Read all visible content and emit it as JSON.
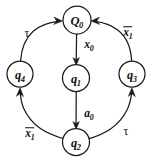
{
  "diagram": {
    "type": "state-transition-graph",
    "title": "",
    "width": 154,
    "height": 162,
    "background_color": "#ffffff",
    "stroke_color": "#1a1a1a",
    "nodes": [
      {
        "id": "Q0",
        "base": "Q",
        "sub": "0",
        "cx": 77,
        "cy": 20,
        "r": 14
      },
      {
        "id": "q1",
        "base": "q",
        "sub": "1",
        "cx": 76,
        "cy": 78,
        "r": 13.5
      },
      {
        "id": "q2",
        "base": "q",
        "sub": "2",
        "cx": 76,
        "cy": 142,
        "r": 13.5
      },
      {
        "id": "q3",
        "base": "q",
        "sub": "3",
        "cx": 132,
        "cy": 74,
        "r": 13
      },
      {
        "id": "q4",
        "base": "q",
        "sub": "4",
        "cx": 20,
        "cy": 74,
        "r": 13
      }
    ],
    "edges": [
      {
        "id": "e-Q0-q1",
        "from": "Q0",
        "to": "q1",
        "label_base": "x",
        "label_sub": "0",
        "overbar": false,
        "label_kind": "var",
        "label_x": 89,
        "label_y": 45
      },
      {
        "id": "e-q1-q2",
        "from": "q1",
        "to": "q2",
        "label_base": "a",
        "label_sub": "0",
        "overbar": false,
        "label_kind": "var",
        "label_x": 89,
        "label_y": 114
      },
      {
        "id": "e-q2-q4",
        "from": "q2",
        "to": "q4",
        "label_base": "x",
        "label_sub": "1",
        "overbar": true,
        "label_kind": "var",
        "label_x": 30,
        "label_y": 134
      },
      {
        "id": "e-q4-Q0",
        "from": "q4",
        "to": "Q0",
        "label_base": "τ",
        "label_sub": "",
        "overbar": false,
        "label_kind": "greek",
        "label_x": 27,
        "label_y": 33
      },
      {
        "id": "e-q2-q3",
        "from": "q2",
        "to": "q3",
        "label_base": "τ",
        "label_sub": "",
        "overbar": false,
        "label_kind": "greek",
        "label_x": 126,
        "label_y": 131
      },
      {
        "id": "e-q3-Q0",
        "from": "q3",
        "to": "Q0",
        "label_base": "x",
        "label_sub": "1",
        "overbar": true,
        "label_kind": "var",
        "label_x": 128,
        "label_y": 33
      }
    ]
  }
}
